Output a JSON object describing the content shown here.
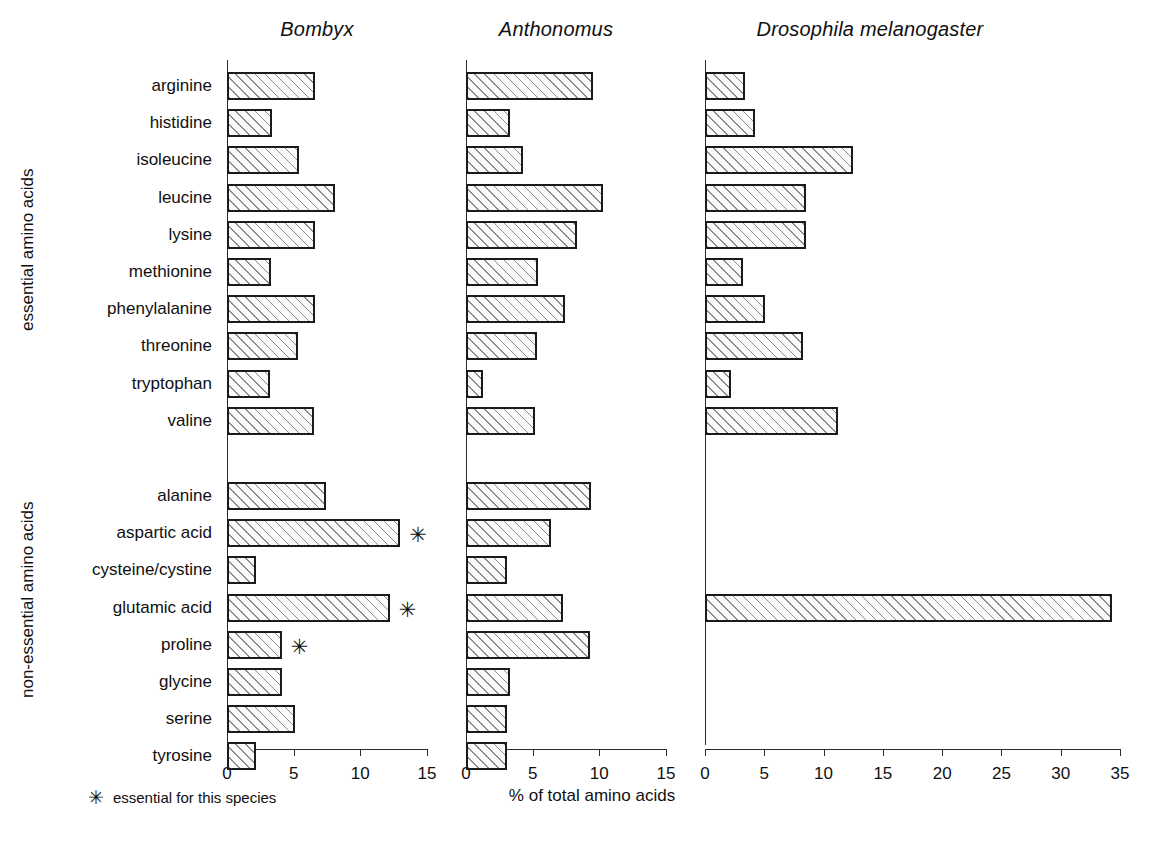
{
  "figure": {
    "x_axis_title": "% of total amino acids",
    "footnote_symbol": "✳",
    "footnote_text": "essential for this species",
    "group_captions": {
      "essential": "essential amino acids",
      "non_essential": "non-essential amino acids"
    }
  },
  "chart_data": {
    "type": "bar",
    "orientation": "horizontal",
    "title": "",
    "xlabel": "% of total amino acids",
    "ylabel": "",
    "grid": false,
    "legend": "none",
    "annotation_symbol": "✳",
    "annotation_meaning": "essential for this species",
    "groups": [
      {
        "name": "essential amino acids",
        "categories": [
          "arginine",
          "histidine",
          "isoleucine",
          "leucine",
          "lysine",
          "methionine",
          "phenylalanine",
          "threonine",
          "tryptophan",
          "valine"
        ]
      },
      {
        "name": "non-essential amino acids",
        "categories": [
          "alanine",
          "aspartic acid",
          "cysteine/cystine",
          "glutamic acid",
          "proline",
          "glycine",
          "serine",
          "tyrosine"
        ]
      }
    ],
    "categories": [
      "arginine",
      "histidine",
      "isoleucine",
      "leucine",
      "lysine",
      "methionine",
      "phenylalanine",
      "threonine",
      "tryptophan",
      "valine",
      "alanine",
      "aspartic acid",
      "cysteine/cystine",
      "glutamic acid",
      "proline",
      "glycine",
      "serine",
      "tyrosine"
    ],
    "panels": [
      {
        "name": "Bombyx",
        "title": "Bombyx",
        "xlim": [
          0,
          15
        ],
        "xticks": [
          0,
          5,
          10,
          15
        ],
        "xtick_labels": [
          "0",
          "5",
          "10",
          "15"
        ],
        "values": [
          6.6,
          3.4,
          5.4,
          8.1,
          6.6,
          3.3,
          6.6,
          5.3,
          3.2,
          6.5,
          7.4,
          13.0,
          2.2,
          12.2,
          4.1,
          4.1,
          5.1,
          2.2
        ],
        "starred": [
          "aspartic acid",
          "glutamic acid",
          "proline"
        ]
      },
      {
        "name": "Anthonomus",
        "title": "Anthonomus",
        "xlim": [
          0,
          15
        ],
        "xticks": [
          0,
          5,
          10,
          15
        ],
        "xtick_labels": [
          "0",
          "5",
          "10",
          "15"
        ],
        "values": [
          9.5,
          3.3,
          4.3,
          10.3,
          8.3,
          5.4,
          7.4,
          5.3,
          1.3,
          5.2,
          9.4,
          6.4,
          3.1,
          7.3,
          9.3,
          3.3,
          3.1,
          3.1
        ],
        "starred": []
      },
      {
        "name": "Drosophila melanogaster",
        "title": "Drosophila melanogaster",
        "xlim": [
          0,
          35
        ],
        "xticks": [
          0,
          5,
          10,
          15,
          20,
          25,
          30,
          35
        ],
        "xtick_labels": [
          "0",
          "5",
          "10",
          "15",
          "20",
          "25",
          "30",
          "35"
        ],
        "values": [
          3.4,
          4.2,
          12.5,
          8.5,
          8.5,
          3.2,
          5.1,
          8.3,
          2.2,
          11.2,
          null,
          null,
          null,
          34.3,
          null,
          null,
          null,
          null
        ],
        "starred": []
      }
    ]
  }
}
